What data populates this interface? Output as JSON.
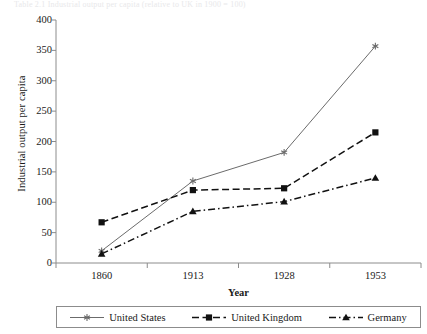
{
  "caption": {
    "text": "Table 2.1  Industrial output per capita (relative to UK in 1900 = 100)"
  },
  "chart_data": {
    "type": "line",
    "title": "",
    "xlabel": "Year",
    "ylabel": "Industrial output per capita",
    "categories": [
      "1860",
      "1913",
      "1928",
      "1953"
    ],
    "ylim": [
      0,
      400
    ],
    "yticks": [
      0,
      50,
      100,
      150,
      200,
      250,
      300,
      350,
      400
    ],
    "grid": false,
    "legend_position": "bottom",
    "series": [
      {
        "name": "United States",
        "values": [
          20,
          135,
          182,
          357
        ],
        "marker": "star",
        "line_style": "solid",
        "color": "#6b6b6b"
      },
      {
        "name": "United Kingdom",
        "values": [
          67,
          120,
          123,
          215
        ],
        "marker": "square",
        "line_style": "dashed",
        "color": "#111111"
      },
      {
        "name": "Germany",
        "values": [
          15,
          85,
          101,
          140
        ],
        "marker": "triangle",
        "line_style": "dashdot",
        "color": "#111111"
      }
    ]
  }
}
